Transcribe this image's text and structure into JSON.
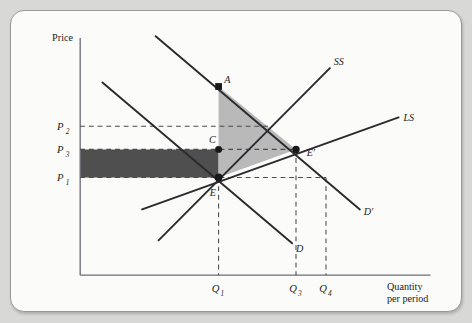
{
  "figure": {
    "type": "economics-supply-demand-diagram",
    "axes": {
      "y_label": "Price",
      "x_label_line1": "Quantity",
      "x_label_line2": "per period"
    },
    "price_ticks": [
      {
        "id": "p2",
        "base": "P",
        "sub": "2",
        "y": 119
      },
      {
        "id": "p3",
        "base": "P",
        "sub": "3",
        "y": 143
      },
      {
        "id": "p1",
        "base": "P",
        "sub": "1",
        "y": 172
      }
    ],
    "quantity_ticks": [
      {
        "id": "q1",
        "base": "Q",
        "sub": "1",
        "x": 212
      },
      {
        "id": "q3",
        "base": "Q",
        "sub": "3",
        "x": 293
      },
      {
        "id": "q4",
        "base": "Q",
        "sub": "4",
        "x": 323
      }
    ],
    "curves": [
      {
        "id": "ss",
        "label": "SS",
        "label_x": 331,
        "label_y": 56,
        "x1": 150,
        "y1": 237,
        "x2": 327,
        "y2": 59
      },
      {
        "id": "ls",
        "label": "LS",
        "label_x": 403,
        "label_y": 114,
        "x1": 133,
        "y1": 205,
        "x2": 398,
        "y2": 110
      },
      {
        "id": "d",
        "label": "D",
        "label_x": 292,
        "label_y": 249,
        "x1": 92,
        "y1": 74,
        "x2": 288,
        "y2": 240
      },
      {
        "id": "dprime",
        "label": "D'",
        "label_x": 362,
        "label_y": 211,
        "x1": 147,
        "y1": 26,
        "x2": 358,
        "y2": 205
      }
    ],
    "points": [
      {
        "id": "a",
        "label": "A",
        "x": 212,
        "y": 78,
        "label_x": 218,
        "label_y": 74
      },
      {
        "id": "c",
        "label": "C",
        "x": 212,
        "y": 143,
        "label_x": 202,
        "label_y": 136
      },
      {
        "id": "e",
        "label": "E",
        "x": 212,
        "y": 172,
        "label_x": 203,
        "label_y": 191
      },
      {
        "id": "eprime",
        "label": "E'",
        "x": 292,
        "y": 143,
        "label_x": 303,
        "label_y": 150
      }
    ],
    "shaded_regions": [
      {
        "id": "welfare-triangle",
        "shade": "light",
        "color": "#b9b9b9",
        "vertices": "212,78 292,143 212,172"
      },
      {
        "id": "transfer-rectangle",
        "shade": "dark",
        "color": "#4f4f4f",
        "vertices": "69,143 212,143 212,172 69,172"
      }
    ],
    "geometry": {
      "y_axis_x": 69,
      "x_axis_y": 273,
      "y_axis_top": 28,
      "x_axis_right": 431
    }
  }
}
